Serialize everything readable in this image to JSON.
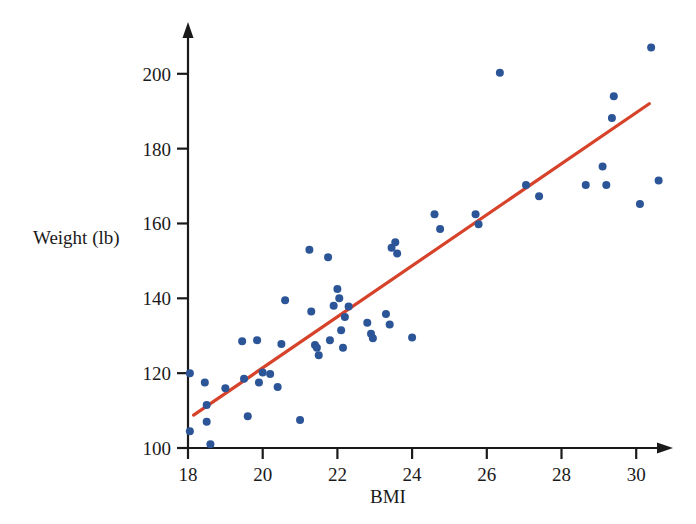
{
  "chart_data": {
    "type": "scatter",
    "title": "",
    "subtitle": "",
    "xlabel": "BMI",
    "ylabel": "Weight (lb)",
    "xlim": [
      17.6,
      31.0
    ],
    "ylim": [
      100,
      208
    ],
    "xticks": [
      18,
      20,
      22,
      24,
      26,
      28,
      30
    ],
    "xtick_labels": [
      "18",
      "20",
      "22",
      "24",
      "26",
      "28",
      "30"
    ],
    "yticks": [
      100,
      120,
      140,
      160,
      180,
      200
    ],
    "ytick_labels": [
      "100",
      "120",
      "140",
      "160",
      "180",
      "200"
    ],
    "grid": false,
    "legend": null,
    "marker_color": "#2b5597",
    "marker_size": 8,
    "axis_color": "#1a1a1a",
    "series": [
      {
        "name": "Subjects",
        "type": "scatter",
        "points": [
          [
            18.05,
            120.0
          ],
          [
            18.05,
            104.5
          ],
          [
            18.45,
            117.5
          ],
          [
            18.5,
            111.5
          ],
          [
            18.5,
            107.0
          ],
          [
            18.6,
            101.0
          ],
          [
            19.0,
            116.0
          ],
          [
            19.45,
            128.5
          ],
          [
            19.5,
            118.5
          ],
          [
            19.6,
            108.5
          ],
          [
            19.85,
            128.8
          ],
          [
            19.9,
            117.5
          ],
          [
            20.0,
            120.2
          ],
          [
            20.2,
            119.8
          ],
          [
            20.4,
            116.3
          ],
          [
            20.5,
            127.8
          ],
          [
            20.6,
            139.5
          ],
          [
            21.0,
            107.5
          ],
          [
            21.25,
            153.0
          ],
          [
            21.3,
            136.5
          ],
          [
            21.4,
            127.5
          ],
          [
            21.45,
            126.8
          ],
          [
            21.5,
            124.8
          ],
          [
            21.75,
            151.0
          ],
          [
            21.8,
            128.8
          ],
          [
            21.9,
            138.0
          ],
          [
            22.0,
            142.5
          ],
          [
            22.05,
            140.0
          ],
          [
            22.1,
            131.5
          ],
          [
            22.15,
            126.8
          ],
          [
            22.2,
            135.0
          ],
          [
            22.3,
            137.8
          ],
          [
            22.8,
            133.5
          ],
          [
            22.9,
            130.5
          ],
          [
            22.95,
            129.3
          ],
          [
            23.3,
            135.8
          ],
          [
            23.4,
            133.0
          ],
          [
            23.45,
            153.5
          ],
          [
            23.55,
            155.0
          ],
          [
            23.6,
            152.0
          ],
          [
            24.0,
            129.5
          ],
          [
            24.6,
            162.5
          ],
          [
            24.75,
            158.5
          ],
          [
            25.7,
            162.5
          ],
          [
            25.78,
            159.8
          ],
          [
            26.35,
            200.3
          ],
          [
            27.05,
            170.3
          ],
          [
            27.4,
            167.3
          ],
          [
            28.65,
            170.3
          ],
          [
            29.1,
            175.2
          ],
          [
            29.2,
            170.3
          ],
          [
            29.35,
            188.2
          ],
          [
            29.4,
            194.0
          ],
          [
            30.1,
            165.2
          ],
          [
            30.4,
            207.0
          ],
          [
            30.6,
            171.5
          ]
        ]
      },
      {
        "name": "Least-squares regression line",
        "type": "line",
        "color": "#d6432a",
        "endpoints": [
          [
            18.15,
            108.8
          ],
          [
            30.35,
            192.0
          ]
        ]
      }
    ]
  }
}
